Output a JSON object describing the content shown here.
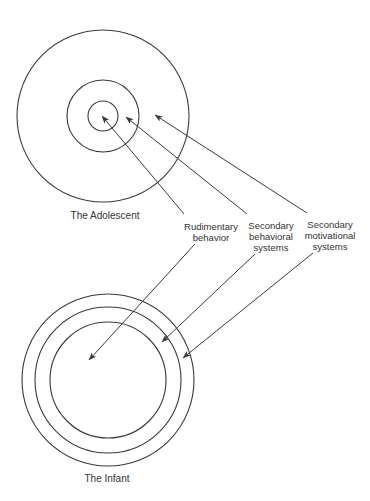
{
  "diagram": {
    "adolescent": {
      "caption": "The Adolescent",
      "center": [
        103,
        116
      ],
      "rings": [
        {
          "name": "rudimentary-behavior-ring",
          "r": 15
        },
        {
          "name": "secondary-behavioral-ring",
          "r": 36
        },
        {
          "name": "secondary-motivational-ring",
          "r": 86
        }
      ]
    },
    "infant": {
      "caption": "The Infant",
      "center": [
        108,
        380
      ],
      "rings": [
        {
          "name": "rudimentary-behavior-ring",
          "r": 58
        },
        {
          "name": "secondary-behavioral-ring",
          "r": 73
        },
        {
          "name": "secondary-motivational-ring",
          "r": 86
        }
      ]
    },
    "labels": [
      {
        "id": "rudimentary-behavior",
        "lines": [
          "Rudimentary",
          "behavior"
        ],
        "anchor": [
          211,
          221
        ],
        "arrow_to_adolescent": {
          "from": [
            184,
            214
          ],
          "to": [
            102,
            116
          ]
        },
        "arrow_to_infant": {
          "from": [
            195,
            244
          ],
          "to": [
            89,
            360
          ]
        }
      },
      {
        "id": "secondary-behavioral-systems",
        "lines": [
          "Secondary",
          "behavioral",
          "systems"
        ],
        "anchor": [
          271,
          220
        ],
        "arrow_to_adolescent": {
          "from": [
            247,
            214
          ],
          "to": [
            126,
            117
          ]
        },
        "arrow_to_infant": {
          "from": [
            255,
            254
          ],
          "to": [
            162,
            342
          ]
        }
      },
      {
        "id": "secondary-motivational-systems",
        "lines": [
          "Secondary",
          "motivational",
          "systems"
        ],
        "anchor": [
          330,
          219
        ],
        "arrow_to_adolescent": {
          "from": [
            307,
            213
          ],
          "to": [
            155,
            115
          ]
        },
        "arrow_to_infant": {
          "from": [
            313,
            253
          ],
          "to": [
            183,
            358
          ]
        }
      }
    ],
    "stroke_color": "#3a3a3a",
    "text_color": "#333333"
  }
}
